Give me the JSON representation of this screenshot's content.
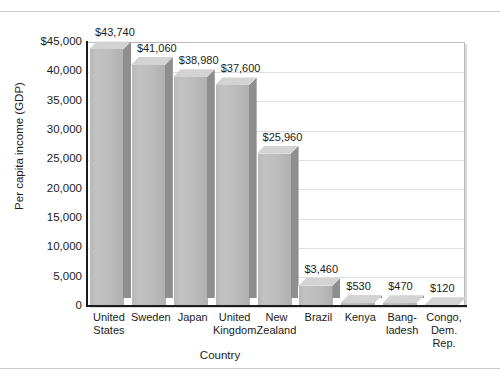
{
  "chart_data": {
    "type": "bar",
    "title": "",
    "xlabel": "Country",
    "ylabel": "Per capita income (GDP)",
    "categories": [
      "United States",
      "Sweden",
      "Japan",
      "United Kingdom",
      "New Zealand",
      "Brazil",
      "Kenya",
      "Bangladesh",
      "Congo, Dem. Rep."
    ],
    "category_lines": [
      [
        "United",
        "States"
      ],
      [
        "Sweden"
      ],
      [
        "Japan"
      ],
      [
        "United",
        "Kingdom"
      ],
      [
        "New",
        "Zealand"
      ],
      [
        "Brazil"
      ],
      [
        "Kenya"
      ],
      [
        "Bang-",
        "ladesh"
      ],
      [
        "Congo,",
        "Dem.",
        "Rep."
      ]
    ],
    "values": [
      43740,
      41060,
      38980,
      37600,
      25960,
      3460,
      530,
      470,
      120
    ],
    "value_labels": [
      "$43,740",
      "$41,060",
      "$38,980",
      "$37,600",
      "$25,960",
      "$3,460",
      "$530",
      "$470",
      "$120"
    ],
    "ylim": [
      0,
      45000
    ],
    "ytick_values": [
      45000,
      40000,
      35000,
      30000,
      25000,
      20000,
      15000,
      10000,
      5000,
      0
    ],
    "ytick_labels": [
      "$45,000",
      "40,000",
      "35,000",
      "30,000",
      "25,000",
      "20,000",
      "15,000",
      "10,000",
      "5,000",
      "0"
    ],
    "grid": true,
    "grid_axis": "y",
    "legend": "none",
    "style": "3d-column",
    "colors": {
      "bar_front": "#bdbdbd",
      "bar_side": "#8e8e8e",
      "bar_top": "#d3d3d3",
      "gridline": "#dddfe1",
      "axis": "#1b1b1b",
      "text": "#1b1b1b",
      "background": "#ffffff"
    }
  }
}
